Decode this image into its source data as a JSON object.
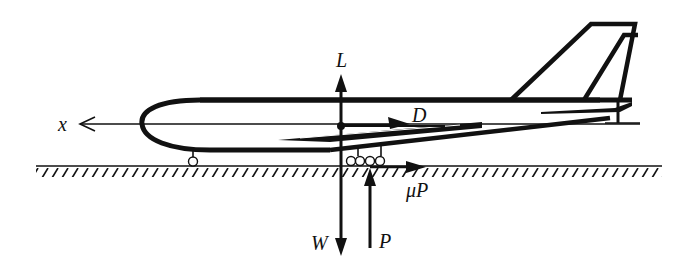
{
  "diagram": {
    "colors": {
      "ink": "#111111",
      "background": "#ffffff"
    },
    "labels": {
      "x_axis": "x",
      "lift": "L",
      "drag": "D",
      "weight": "W",
      "normal_force": "P",
      "friction": "μP"
    },
    "forces": [
      {
        "symbol": "L",
        "name": "lift",
        "direction": "up"
      },
      {
        "symbol": "D",
        "name": "drag",
        "direction": "right (aft)"
      },
      {
        "symbol": "W",
        "name": "weight",
        "direction": "down"
      },
      {
        "symbol": "P",
        "name": "ground reaction",
        "direction": "up"
      },
      {
        "symbol": "μP",
        "name": "rolling friction",
        "direction": "right (aft)"
      }
    ],
    "axis": {
      "symbol": "x",
      "direction": "left (forward)"
    }
  }
}
